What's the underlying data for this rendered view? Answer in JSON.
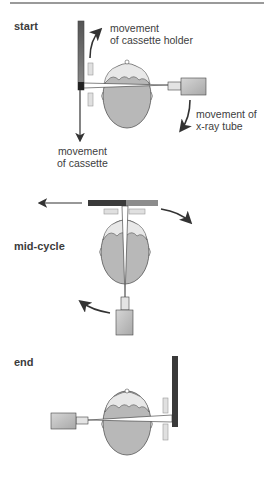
{
  "figure": {
    "stages": [
      {
        "id": "start",
        "label": "start"
      },
      {
        "id": "mid",
        "label": "mid-cycle"
      },
      {
        "id": "end",
        "label": "end"
      }
    ],
    "annotations": {
      "cassette_holder_line1": "movement",
      "cassette_holder_line2": "of cassette holder",
      "xray_tube_line1": "movement of",
      "xray_tube_line2": "x-ray tube",
      "cassette_line1": "movement",
      "cassette_line2": "of cassette"
    },
    "colors": {
      "head_fill": "#b8b8b8",
      "hair_fill": "#e6e6e6",
      "outline": "#555555",
      "cassette_dark": "#444444",
      "cassette_light": "#9a9a9a",
      "tube_fill": "#c8c8c8",
      "arrow": "#333333"
    }
  }
}
